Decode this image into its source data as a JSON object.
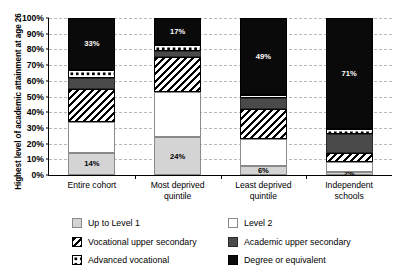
{
  "chart_data": {
    "type": "bar",
    "subtype": "stacked-100-percent",
    "title": "",
    "xlabel": "",
    "ylabel": "Highest level of academic attainment at age 26",
    "ylim": [
      0,
      100
    ],
    "ytick_labels": [
      "0%",
      "10%",
      "20%",
      "30%",
      "40%",
      "50%",
      "60%",
      "70%",
      "80%",
      "90%",
      "100%"
    ],
    "ytick_values": [
      0,
      10,
      20,
      30,
      40,
      50,
      60,
      70,
      80,
      90,
      100
    ],
    "grid": true,
    "legend_position": "bottom",
    "categories": [
      "Entire cohort",
      "Most deprived quintile",
      "Least deprived quintile",
      "Independent schools"
    ],
    "series": [
      {
        "name": "Up to Level 1",
        "key": "uptolevel1",
        "values": [
          14,
          24,
          6,
          2
        ]
      },
      {
        "name": "Level 2",
        "key": "level2",
        "values": [
          20,
          29,
          17,
          6
        ]
      },
      {
        "name": "Vocational upper secondary",
        "key": "vocational",
        "values": [
          21,
          22,
          19,
          6
        ]
      },
      {
        "name": "Academic upper secondary",
        "key": "academic",
        "values": [
          7,
          4,
          7,
          12
        ]
      },
      {
        "name": "Advanced vocational",
        "key": "advanced",
        "values": [
          5,
          4,
          2,
          3
        ]
      },
      {
        "name": "Degree or equivalent",
        "key": "degree",
        "values": [
          33,
          17,
          49,
          71
        ]
      }
    ],
    "data_labels": [
      {
        "category": "Entire cohort",
        "series": "Up to Level 1",
        "text": "14%"
      },
      {
        "category": "Entire cohort",
        "series": "Degree or equivalent",
        "text": "33%"
      },
      {
        "category": "Most deprived quintile",
        "series": "Up to Level 1",
        "text": "24%"
      },
      {
        "category": "Most deprived quintile",
        "series": "Degree or equivalent",
        "text": "17%"
      },
      {
        "category": "Least deprived quintile",
        "series": "Up to Level 1",
        "text": "6%"
      },
      {
        "category": "Least deprived quintile",
        "series": "Degree or equivalent",
        "text": "49%"
      },
      {
        "category": "Independent schools",
        "series": "Up to Level 1",
        "text": "2%"
      },
      {
        "category": "Independent schools",
        "series": "Degree or equivalent",
        "text": "71%"
      }
    ]
  },
  "axis": {
    "y_title": "Highest level of academic attainment at age 26",
    "ticks": [
      {
        "label": "100%",
        "value": 100
      },
      {
        "label": "90%",
        "value": 90
      },
      {
        "label": "80%",
        "value": 80
      },
      {
        "label": "70%",
        "value": 70
      },
      {
        "label": "60%",
        "value": 60
      },
      {
        "label": "50%",
        "value": 50
      },
      {
        "label": "40%",
        "value": 40
      },
      {
        "label": "30%",
        "value": 30
      },
      {
        "label": "20%",
        "value": 20
      },
      {
        "label": "10%",
        "value": 10
      },
      {
        "label": "0%",
        "value": 0
      }
    ]
  },
  "bars": [
    {
      "category_line1": "Entire cohort",
      "category_line2": "",
      "segments": [
        {
          "key": "degree",
          "label": "Degree or equivalent",
          "value": 33,
          "data_label": "33%",
          "label_color": "#ffffff"
        },
        {
          "key": "advanced",
          "label": "Advanced vocational",
          "value": 5,
          "data_label": ""
        },
        {
          "key": "academic",
          "label": "Academic upper secondary",
          "value": 7,
          "data_label": ""
        },
        {
          "key": "vocational",
          "label": "Vocational upper secondary",
          "value": 21,
          "data_label": ""
        },
        {
          "key": "level2",
          "label": "Level 2",
          "value": 20,
          "data_label": ""
        },
        {
          "key": "uptolevel1",
          "label": "Up to Level 1",
          "value": 14,
          "data_label": "14%",
          "label_color": "#000000"
        }
      ]
    },
    {
      "category_line1": "Most deprived",
      "category_line2": "quintile",
      "segments": [
        {
          "key": "degree",
          "label": "Degree or equivalent",
          "value": 17,
          "data_label": "17%",
          "label_color": "#ffffff"
        },
        {
          "key": "advanced",
          "label": "Advanced vocational",
          "value": 4,
          "data_label": ""
        },
        {
          "key": "academic",
          "label": "Academic upper secondary",
          "value": 4,
          "data_label": ""
        },
        {
          "key": "vocational",
          "label": "Vocational upper secondary",
          "value": 22,
          "data_label": ""
        },
        {
          "key": "level2",
          "label": "Level 2",
          "value": 29,
          "data_label": ""
        },
        {
          "key": "uptolevel1",
          "label": "Up to Level 1",
          "value": 24,
          "data_label": "24%",
          "label_color": "#000000"
        }
      ]
    },
    {
      "category_line1": "Least deprived",
      "category_line2": "quintile",
      "segments": [
        {
          "key": "degree",
          "label": "Degree or equivalent",
          "value": 49,
          "data_label": "49%",
          "label_color": "#ffffff"
        },
        {
          "key": "advanced",
          "label": "Advanced vocational",
          "value": 2,
          "data_label": ""
        },
        {
          "key": "academic",
          "label": "Academic upper secondary",
          "value": 7,
          "data_label": ""
        },
        {
          "key": "vocational",
          "label": "Vocational upper secondary",
          "value": 19,
          "data_label": ""
        },
        {
          "key": "level2",
          "label": "Level 2",
          "value": 17,
          "data_label": ""
        },
        {
          "key": "uptolevel1",
          "label": "Up to Level 1",
          "value": 6,
          "data_label": "6%",
          "label_color": "#000000"
        }
      ]
    },
    {
      "category_line1": "Independent",
      "category_line2": "schools",
      "segments": [
        {
          "key": "degree",
          "label": "Degree or equivalent",
          "value": 71,
          "data_label": "71%",
          "label_color": "#ffffff"
        },
        {
          "key": "advanced",
          "label": "Advanced vocational",
          "value": 3,
          "data_label": ""
        },
        {
          "key": "academic",
          "label": "Academic upper secondary",
          "value": 12,
          "data_label": ""
        },
        {
          "key": "vocational",
          "label": "Vocational upper secondary",
          "value": 6,
          "data_label": ""
        },
        {
          "key": "level2",
          "label": "Level 2",
          "value": 6,
          "data_label": ""
        },
        {
          "key": "uptolevel1",
          "label": "Up to Level 1",
          "value": 2,
          "data_label": "2%",
          "label_color": "#000000"
        }
      ]
    }
  ],
  "legend": {
    "left_column": [
      {
        "key": "uptolevel1",
        "label": "Up to Level 1"
      },
      {
        "key": "vocational",
        "label": "Vocational upper secondary"
      },
      {
        "key": "advanced",
        "label": "Advanced vocational"
      }
    ],
    "right_column": [
      {
        "key": "level2",
        "label": "Level 2"
      },
      {
        "key": "academic",
        "label": "Academic upper secondary"
      },
      {
        "key": "degree",
        "label": "Degree or equivalent"
      }
    ]
  },
  "colors": {
    "uptolevel1": "#d4d4d4",
    "level2": "#ffffff",
    "vocational_hatch": "#000000",
    "academic": "#4a4a4a",
    "advanced_dots": "#000000",
    "degree": "#0a0a0a",
    "gridline": "#b9b9b9",
    "axis": "#000000"
  }
}
